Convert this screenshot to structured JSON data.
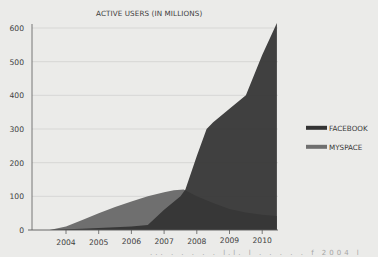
{
  "chart_data": {
    "type": "area",
    "title": "ACTIVE USERS (IN MILLIONS)",
    "xlabel": "",
    "ylabel": "",
    "ylim": [
      0,
      600
    ],
    "xlim": [
      2003.0,
      2010.45
    ],
    "yticks": [
      0,
      100,
      200,
      300,
      400,
      500,
      600
    ],
    "xticks": [
      2004,
      2005,
      2006,
      2007,
      2008,
      2009,
      2010
    ],
    "grid": true,
    "legend_position": "right",
    "series": [
      {
        "name": "MYSPACE",
        "color": "#6f6f6f",
        "points": [
          [
            2003.5,
            0
          ],
          [
            2004.0,
            10
          ],
          [
            2004.5,
            30
          ],
          [
            2005.0,
            50
          ],
          [
            2005.5,
            68
          ],
          [
            2006.0,
            85
          ],
          [
            2006.5,
            100
          ],
          [
            2007.0,
            112
          ],
          [
            2007.3,
            118
          ],
          [
            2007.6,
            120
          ],
          [
            2008.0,
            100
          ],
          [
            2008.5,
            80
          ],
          [
            2009.0,
            62
          ],
          [
            2009.5,
            52
          ],
          [
            2010.0,
            45
          ],
          [
            2010.45,
            42
          ]
        ]
      },
      {
        "name": "FACEBOOK",
        "color": "#333333",
        "points": [
          [
            2003.5,
            0
          ],
          [
            2004.0,
            2
          ],
          [
            2004.5,
            4
          ],
          [
            2005.0,
            6
          ],
          [
            2005.5,
            8
          ],
          [
            2006.0,
            10
          ],
          [
            2006.5,
            15
          ],
          [
            2007.0,
            60
          ],
          [
            2007.5,
            100
          ],
          [
            2007.65,
            120
          ],
          [
            2008.0,
            220
          ],
          [
            2008.3,
            300
          ],
          [
            2008.5,
            320
          ],
          [
            2009.0,
            360
          ],
          [
            2009.5,
            400
          ],
          [
            2010.0,
            520
          ],
          [
            2010.45,
            615
          ]
        ]
      }
    ]
  },
  "footer": {
    "cutoff_text": "...  .  .  .  .  . l.l. l  .  .  .  .  .  f  2004  l"
  }
}
